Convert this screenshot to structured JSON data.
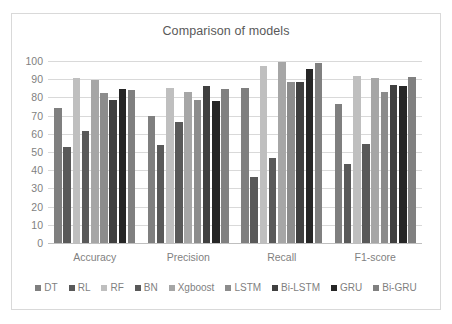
{
  "chart_data": {
    "type": "bar",
    "title": "Comparison of models",
    "xlabel": "",
    "ylabel": "",
    "ylim": [
      0,
      100
    ],
    "yticks": [
      0,
      10,
      20,
      30,
      40,
      50,
      60,
      70,
      80,
      90,
      100
    ],
    "grid": true,
    "legend_position": "bottom",
    "categories": [
      "Accuracy",
      "Precision",
      "Recall",
      "F1-score"
    ],
    "series": [
      {
        "name": "DT",
        "color": "#7f7f7f",
        "values": [
          74.0,
          69.8,
          85.0,
          76.5
        ]
      },
      {
        "name": "RL",
        "color": "#595959",
        "values": [
          52.5,
          54.0,
          36.5,
          43.5
        ]
      },
      {
        "name": "RF",
        "color": "#bfbfbf",
        "values": [
          90.4,
          85.4,
          97.4,
          91.5
        ]
      },
      {
        "name": "BN",
        "color": "#595959",
        "values": [
          61.4,
          66.5,
          46.5,
          54.5
        ]
      },
      {
        "name": "Xgboost",
        "color": "#a6a6a6",
        "values": [
          89.6,
          83.0,
          99.6,
          90.4
        ]
      },
      {
        "name": "LSTM",
        "color": "#8c8c8c",
        "values": [
          82.2,
          78.4,
          88.2,
          83.0
        ]
      },
      {
        "name": "Bi-LSTM",
        "color": "#404040",
        "values": [
          78.4,
          86.1,
          88.4,
          87.0
        ]
      },
      {
        "name": "GRU",
        "color": "#262626",
        "values": [
          84.4,
          78.3,
          95.6,
          86.0
        ]
      },
      {
        "name": "Bi-GRU",
        "color": "#808080",
        "values": [
          84.1,
          84.8,
          98.9,
          91.4
        ]
      }
    ]
  }
}
